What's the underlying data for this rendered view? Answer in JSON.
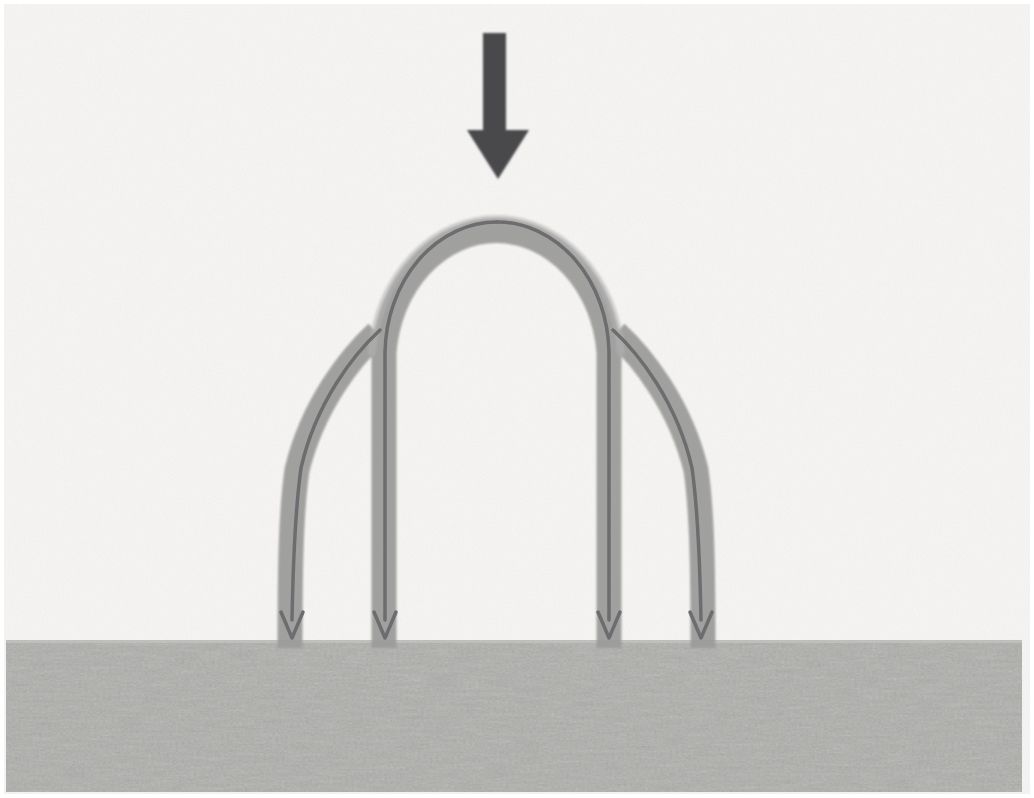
{
  "figure": {
    "type": "technical-illustration",
    "width": 1034,
    "height": 798,
    "background_color": "#f6f5f3",
    "paper_texture": true
  },
  "colors": {
    "background": "#f6f5f3",
    "background_edge": "#ffffff",
    "load_arrow": "#4a4a4c",
    "flow_band": "#9d9d9c",
    "flow_band_light": "#aeaeae",
    "trajectory_line": "#6d6d70",
    "ground_fill": "#d9d9d7",
    "ground_speckle": "#a9a9a7"
  },
  "elements": {
    "load_arrow": {
      "name": "applied-load-arrow",
      "description": "Large solid downward arrow indicating the applied vertical load at the arch crown",
      "color": "#4a4a4c",
      "shaft": {
        "x": 483,
        "y_top": 33,
        "width": 23,
        "y_bottom": 132
      },
      "head": {
        "x_left": 467,
        "x_right": 529,
        "y_top": 130,
        "y_tip": 179
      },
      "direction": "down"
    },
    "arch": {
      "name": "arch-flow-band",
      "description": "Semicircular arch drawn as a thick grey band carrying the force flow",
      "band_width": 25,
      "crown": {
        "cx": 497,
        "cy": 345,
        "outer_radius": 134,
        "inner_radius": 109
      },
      "crown_top_y": 211,
      "springing_y": 345
    },
    "legs": [
      {
        "name": "leg-outer-left",
        "center_x": 290,
        "y_top": 340,
        "y_bottom": 640,
        "splits_at": {
          "x": 375,
          "y": 337
        }
      },
      {
        "name": "leg-inner-left",
        "center_x": 384,
        "y_top": 345,
        "y_bottom": 640,
        "splits_at": null
      },
      {
        "name": "leg-inner-right",
        "center_x": 609,
        "y_top": 345,
        "y_bottom": 640,
        "splits_at": null
      },
      {
        "name": "leg-outer-right",
        "center_x": 693,
        "y_top": 340,
        "y_bottom": 640,
        "splits_at": {
          "x": 619,
          "y": 337
        }
      }
    ],
    "trajectory_arrows": {
      "name": "force-trajectory-arrows",
      "description": "Thin dark centre lines inside each band terminating in open chevron arrowheads at the ground",
      "count": 4,
      "line_width": 3.5,
      "head_half_width": 11,
      "head_length": 22,
      "tip_y": 640,
      "color": "#6d6d70"
    },
    "ground": {
      "name": "ground-layer",
      "description": "Speckled grey band representing the soil / foundation the arch thrust is delivered into",
      "x": 6,
      "y": 640,
      "width": 1016,
      "height": 152,
      "fill": "#d9d9d7"
    }
  },
  "annotations": {
    "labels": [],
    "note": "No text labels appear in the illustration"
  }
}
